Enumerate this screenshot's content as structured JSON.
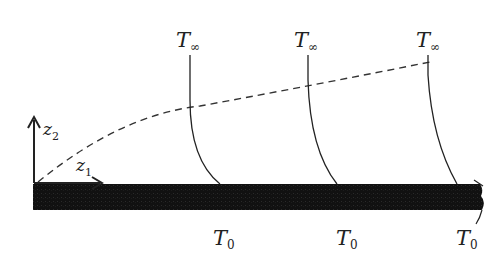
{
  "diagram": {
    "axes": {
      "z1_label": "z",
      "z1_sub": "1",
      "z2_label": "z",
      "z2_sub": "2"
    },
    "free_stream_labels": [
      {
        "main": "T",
        "sub": "∞"
      },
      {
        "main": "T",
        "sub": "∞"
      },
      {
        "main": "T",
        "sub": "∞"
      }
    ],
    "wall_labels": [
      {
        "main": "T",
        "sub": "0"
      },
      {
        "main": "T",
        "sub": "0"
      },
      {
        "main": "T",
        "sub": "0"
      }
    ],
    "colors": {
      "plate": "#111111",
      "line": "#222222"
    }
  }
}
